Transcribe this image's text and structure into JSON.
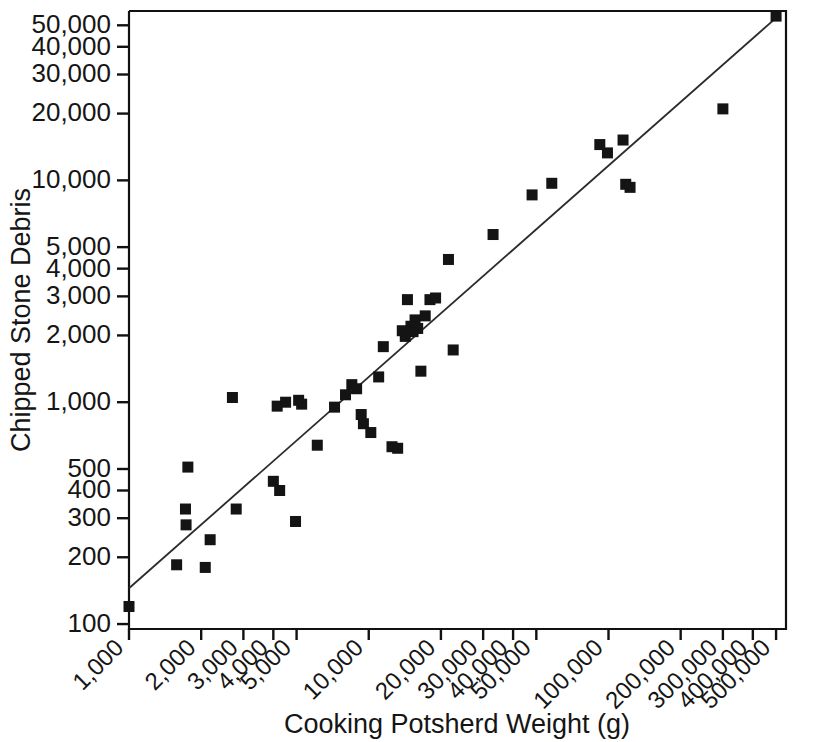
{
  "chart_data": {
    "type": "scatter",
    "title": "",
    "xlabel": "Cooking Potsherd Weight (g)",
    "ylabel": "Chipped Stone Debris",
    "xscale": "log",
    "yscale": "log",
    "xlim": [
      1000,
      550000
    ],
    "ylim": [
      95,
      58000
    ],
    "grid": false,
    "legend": null,
    "xticks": [
      1000,
      2000,
      3000,
      4000,
      5000,
      10000,
      20000,
      30000,
      40000,
      50000,
      100000,
      200000,
      300000,
      400000,
      500000
    ],
    "xticklabels": [
      "1,000",
      "2,000",
      "3,000",
      "4,000",
      "5,000",
      "10,000",
      "20,000",
      "30,000",
      "40,000",
      "50,000",
      "100,000",
      "200,000",
      "300,000",
      "400,000",
      "500,000"
    ],
    "yticks": [
      100,
      200,
      300,
      400,
      500,
      1000,
      2000,
      3000,
      4000,
      5000,
      10000,
      20000,
      30000,
      40000,
      50000
    ],
    "yticklabels": [
      "100",
      "200",
      "300",
      "400",
      "500",
      "1,000",
      "2,000",
      "3,000",
      "4,000",
      "5,000",
      "10,000",
      "20,000",
      "30,000",
      "40,000",
      "50,000"
    ],
    "xtick_label_rotation": 45,
    "marker": "square",
    "marker_color": "#141414",
    "marker_size": 11,
    "points": [
      {
        "x": 1000,
        "y": 120
      },
      {
        "x": 1580,
        "y": 185
      },
      {
        "x": 1720,
        "y": 330
      },
      {
        "x": 1730,
        "y": 280
      },
      {
        "x": 1760,
        "y": 510
      },
      {
        "x": 2080,
        "y": 180
      },
      {
        "x": 2180,
        "y": 240
      },
      {
        "x": 2700,
        "y": 1050
      },
      {
        "x": 2800,
        "y": 330
      },
      {
        "x": 4000,
        "y": 440
      },
      {
        "x": 4250,
        "y": 400
      },
      {
        "x": 4150,
        "y": 960
      },
      {
        "x": 4500,
        "y": 1000
      },
      {
        "x": 4950,
        "y": 290
      },
      {
        "x": 5100,
        "y": 1020
      },
      {
        "x": 5250,
        "y": 980
      },
      {
        "x": 6100,
        "y": 640
      },
      {
        "x": 7200,
        "y": 950
      },
      {
        "x": 8000,
        "y": 1080
      },
      {
        "x": 8500,
        "y": 1200
      },
      {
        "x": 8900,
        "y": 1150
      },
      {
        "x": 9300,
        "y": 880
      },
      {
        "x": 9500,
        "y": 800
      },
      {
        "x": 10200,
        "y": 730
      },
      {
        "x": 11000,
        "y": 1300
      },
      {
        "x": 11500,
        "y": 1780
      },
      {
        "x": 12500,
        "y": 630
      },
      {
        "x": 13200,
        "y": 620
      },
      {
        "x": 13800,
        "y": 2100
      },
      {
        "x": 14200,
        "y": 1980
      },
      {
        "x": 14500,
        "y": 2900
      },
      {
        "x": 15000,
        "y": 2200
      },
      {
        "x": 15300,
        "y": 2080
      },
      {
        "x": 15600,
        "y": 2350
      },
      {
        "x": 16000,
        "y": 2150
      },
      {
        "x": 16500,
        "y": 1380
      },
      {
        "x": 17200,
        "y": 2450
      },
      {
        "x": 18000,
        "y": 2900
      },
      {
        "x": 19000,
        "y": 2950
      },
      {
        "x": 21500,
        "y": 4400
      },
      {
        "x": 22500,
        "y": 1720
      },
      {
        "x": 33000,
        "y": 5700
      },
      {
        "x": 48000,
        "y": 8600
      },
      {
        "x": 58000,
        "y": 9700
      },
      {
        "x": 92000,
        "y": 14500
      },
      {
        "x": 99000,
        "y": 13300
      },
      {
        "x": 115000,
        "y": 15200
      },
      {
        "x": 118000,
        "y": 9600
      },
      {
        "x": 123000,
        "y": 9300
      },
      {
        "x": 300000,
        "y": 21000
      },
      {
        "x": 500000,
        "y": 55000
      }
    ],
    "trendline": {
      "type": "linear-log-log",
      "x_start": 1000,
      "y_start": 145,
      "x_end": 500000,
      "y_end": 54000,
      "color": "#2b2b2b"
    }
  },
  "figure": {
    "background": "#ffffff",
    "frame_color": "#111111"
  }
}
